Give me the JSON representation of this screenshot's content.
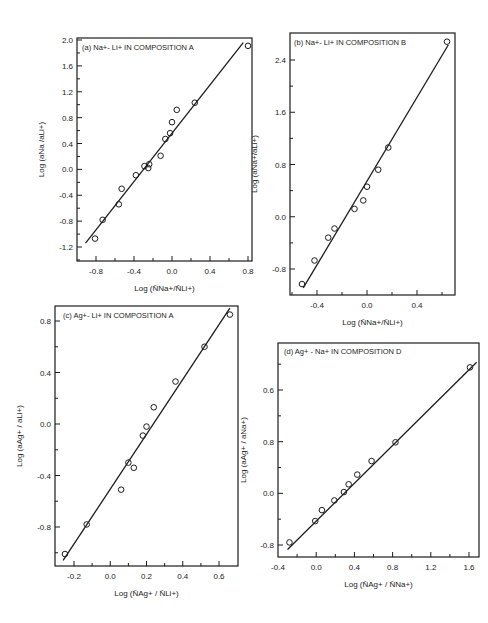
{
  "chart_data": [
    {
      "type": "scatter",
      "panel": "a",
      "title": "(a) Na+- Li+ IN COMPOSITION A",
      "xlabel": "Log (N̄Na+/N̄Li+)",
      "ylabel": "Log (aNa /aLi+)",
      "xlim": [
        -1.0,
        0.85
      ],
      "ylim": [
        -1.45,
        2.0
      ],
      "xticks": [
        -0.8,
        -0.4,
        0.0,
        0.4,
        0.8
      ],
      "xtick_labels": [
        "-0.8",
        "-0.4",
        "0.0",
        "0.4",
        "0.8"
      ],
      "yticks": [
        -1.2,
        -0.8,
        -0.4,
        0.0,
        0.4,
        0.8,
        1.2,
        1.6,
        2.0
      ],
      "ytick_labels": [
        "-1.2",
        "-0.8",
        "-0.4",
        "0.0",
        "0.4",
        "0.8",
        "1.2",
        "1.6",
        "2.0"
      ],
      "grid": false,
      "points": [
        [
          -0.81,
          -1.07
        ],
        [
          -0.73,
          -0.78
        ],
        [
          -0.56,
          -0.54
        ],
        [
          -0.53,
          -0.3
        ],
        [
          -0.38,
          -0.09
        ],
        [
          -0.29,
          0.05
        ],
        [
          -0.25,
          0.02
        ],
        [
          -0.24,
          0.08
        ],
        [
          -0.12,
          0.21
        ],
        [
          -0.07,
          0.47
        ],
        [
          -0.02,
          0.56
        ],
        [
          0.0,
          0.73
        ],
        [
          0.05,
          0.92
        ],
        [
          0.24,
          1.03
        ],
        [
          0.8,
          1.91
        ]
      ],
      "fit_line": [
        [
          -0.91,
          -1.14
        ],
        [
          0.75,
          1.96
        ]
      ]
    },
    {
      "type": "scatter",
      "panel": "b",
      "title": "(b) Na+- Li+ IN COMPOSITION B",
      "xlabel": "Log (N̄Na+/N̄Li+)",
      "ylabel": "Log (aNa+/aLi+)",
      "xlim": [
        -0.6,
        0.7
      ],
      "ylim": [
        -1.2,
        2.8
      ],
      "xticks": [
        -0.4,
        0.0,
        0.4
      ],
      "xtick_labels": [
        "-0.4",
        "0.0",
        "0.4"
      ],
      "yticks": [
        -0.8,
        0.0,
        0.8,
        1.6,
        2.4
      ],
      "ytick_labels": [
        "-0.8",
        "0.0",
        "0.8",
        "1.6",
        "2.4"
      ],
      "grid": false,
      "points": [
        [
          -0.52,
          -1.03
        ],
        [
          -0.42,
          -0.67
        ],
        [
          -0.31,
          -0.32
        ],
        [
          -0.26,
          -0.18
        ],
        [
          -0.1,
          0.12
        ],
        [
          -0.03,
          0.25
        ],
        [
          0.0,
          0.46
        ],
        [
          0.09,
          0.72
        ],
        [
          0.17,
          1.06
        ],
        [
          0.64,
          2.68
        ]
      ],
      "fit_line": [
        [
          -0.51,
          -1.09
        ],
        [
          0.65,
          2.63
        ]
      ]
    },
    {
      "type": "scatter",
      "panel": "c",
      "title": "(c) Ag+- Li+ IN COMPOSITION A",
      "xlabel": "Log (N̄Ag+ / N̄Li+)",
      "ylabel": "Log (aAg+ / aLi+)",
      "xlim": [
        -0.3,
        0.68
      ],
      "ylim": [
        -1.08,
        0.92
      ],
      "xticks": [
        -0.2,
        0.0,
        0.2,
        0.4,
        0.6
      ],
      "xtick_labels": [
        "-0.2",
        "0.0",
        "0.2",
        "0.4",
        "0.6"
      ],
      "yticks": [
        -0.8,
        -0.4,
        0.0,
        0.4,
        0.8
      ],
      "ytick_labels": [
        "-0.8",
        "-0.4",
        "0.0",
        "0.4",
        "0.8"
      ],
      "grid": false,
      "points": [
        [
          -0.25,
          -1.01
        ],
        [
          -0.13,
          -0.78
        ],
        [
          0.06,
          -0.51
        ],
        [
          0.1,
          -0.3
        ],
        [
          0.13,
          -0.34
        ],
        [
          0.18,
          -0.09
        ],
        [
          0.2,
          -0.02
        ],
        [
          0.24,
          0.13
        ],
        [
          0.36,
          0.33
        ],
        [
          0.52,
          0.6
        ],
        [
          0.66,
          0.85
        ]
      ],
      "fit_line": [
        [
          -0.26,
          -1.06
        ],
        [
          0.66,
          0.9
        ]
      ]
    },
    {
      "type": "scatter",
      "panel": "d",
      "title": "(d) Ag+ - Na+ IN COMPOSITION D",
      "xlabel": "Log (N̄Ag+ / N̄Na+)",
      "ylabel": "Log (aAg+ / aNa+)",
      "xlim": [
        -0.4,
        1.72
      ],
      "ylim": [
        -0.98,
        2.35
      ],
      "xticks": [
        -0.4,
        0.0,
        0.4,
        0.8,
        1.2,
        1.6
      ],
      "xtick_labels": [
        "-0.4",
        "0.0",
        "0.4",
        "0.8",
        "1.2",
        "1.6"
      ],
      "yticks": [
        -0.8,
        0.0,
        0.8,
        1.6
      ],
      "ytick_labels": [
        "-0.8",
        "0.0",
        "0.8",
        "0.6"
      ],
      "grid": false,
      "points": [
        [
          -0.28,
          -0.76
        ],
        [
          -0.01,
          -0.43
        ],
        [
          0.06,
          -0.26
        ],
        [
          0.19,
          -0.11
        ],
        [
          0.29,
          0.02
        ],
        [
          0.34,
          0.14
        ],
        [
          0.43,
          0.29
        ],
        [
          0.58,
          0.5
        ],
        [
          0.83,
          0.79
        ],
        [
          1.61,
          1.95
        ]
      ],
      "fit_line": [
        [
          -0.3,
          -0.87
        ],
        [
          1.68,
          2.03
        ]
      ]
    }
  ]
}
